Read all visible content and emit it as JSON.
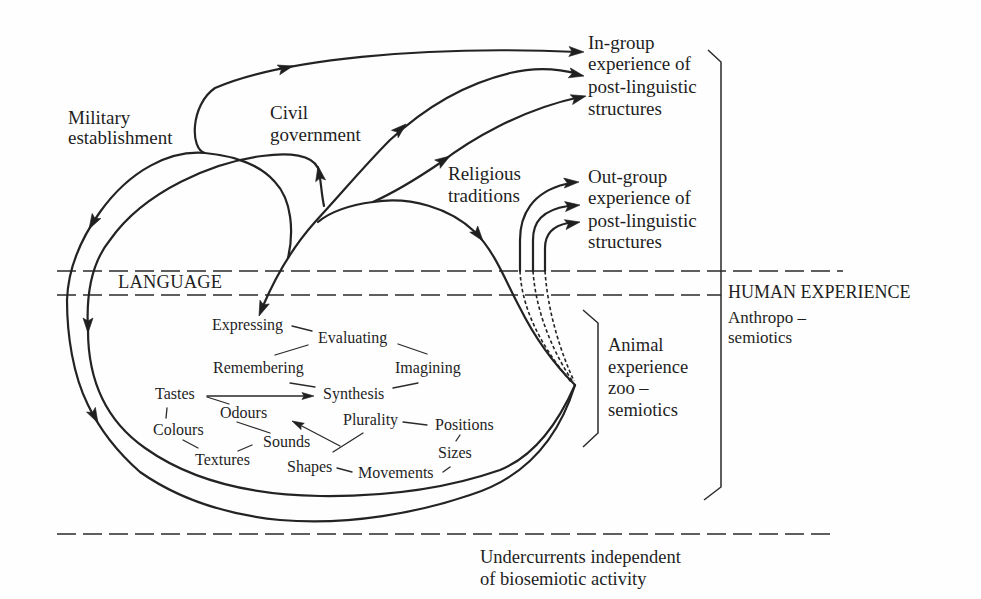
{
  "diagram": {
    "institutions": {
      "military": [
        "Military",
        "establishment"
      ],
      "civil": [
        "Civil",
        "government"
      ],
      "religious": [
        "Religious",
        "traditions"
      ]
    },
    "outcomes": {
      "in_group": [
        "In-group",
        "experience of",
        "post-linguistic",
        "structures"
      ],
      "out_group": [
        "Out-group",
        "experience of",
        "post-linguistic",
        "structures"
      ]
    },
    "bands": {
      "language": "LANGUAGE",
      "human": {
        "title": "HUMAN EXPERIENCE",
        "lines": [
          "Anthropo –",
          "semiotics"
        ]
      },
      "animal": [
        "Animal",
        "experience",
        "zoo –",
        "semiotics"
      ],
      "undercurrents": [
        "Undercurrents independent",
        "of biosemiotic activity"
      ]
    },
    "cognitive_nodes": {
      "expressing": "Expressing",
      "evaluating": "Evaluating",
      "remembering": "Remembering",
      "imagining": "Imagining",
      "synthesis": "Synthesis"
    },
    "sensory_nodes": {
      "tastes": "Tastes",
      "odours": "Odours",
      "colours": "Colours",
      "textures": "Textures",
      "sounds": "Sounds",
      "plurality": "Plurality",
      "positions": "Positions",
      "sizes": "Sizes",
      "shapes": "Shapes",
      "movements": "Movements"
    },
    "colors": {
      "ink": "#232323",
      "background": "#fefefe"
    }
  }
}
